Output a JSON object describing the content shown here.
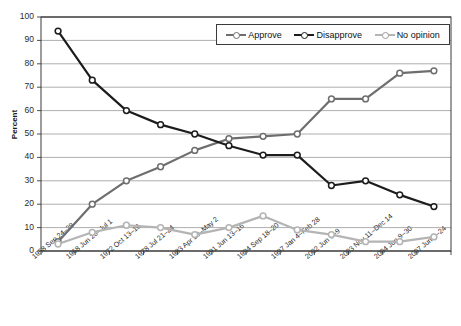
{
  "title": "",
  "axes": {
    "ylabel": "Percent",
    "yticks": [
      "100",
      "90",
      "80",
      "70",
      "60",
      "50",
      "40",
      "30",
      "20",
      "10",
      "0"
    ],
    "ylim": [
      0,
      100
    ]
  },
  "legend": {
    "position": "top-right",
    "items": [
      {
        "label": "Approve",
        "color": "#6e6e6e"
      },
      {
        "label": "Disapprove",
        "color": "#1c1c1c"
      },
      {
        "label": "No opinion",
        "color": "#b4b4b4"
      }
    ]
  },
  "chart_data": {
    "type": "line",
    "title": "",
    "xlabel": "",
    "ylabel": "Percent",
    "ylim": [
      0,
      100
    ],
    "grid": true,
    "categories": [
      "1958 Sep 24-29",
      "1968 Jun 26-Jul 1",
      "1972 Oct 13-16",
      "1978 Jul 21-24",
      "1983 Apr 29-May 2",
      "1991 Jun 13-16",
      "1994 Sep 18-20",
      "1997 Jan 4-Feb 28",
      "2002 Jun 3-9",
      "2003 Nov 11-Dec 14",
      "2004 Jun 9-30",
      "2007 Jun 4-24"
    ],
    "series": [
      {
        "name": "Approve",
        "color": "#6e6e6e",
        "values": [
          4,
          20,
          30,
          36,
          43,
          48,
          49,
          50,
          65,
          65,
          76,
          77
        ]
      },
      {
        "name": "Disapprove",
        "color": "#1c1c1c",
        "values": [
          94,
          73,
          60,
          54,
          50,
          45,
          41,
          41,
          28,
          30,
          24,
          19
        ]
      },
      {
        "name": "No opinion",
        "color": "#b4b4b4",
        "values": [
          3,
          8,
          11,
          10,
          7,
          10,
          15,
          9,
          7,
          4,
          4,
          6
        ]
      }
    ]
  }
}
